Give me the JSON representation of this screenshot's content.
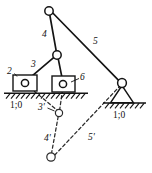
{
  "figure": {
    "type": "kinematic-linkage-diagram",
    "background_color": "#ffffff",
    "line_color": "#141414",
    "dashed_color": "#2a2a2a"
  },
  "labels": {
    "link_2": "2",
    "link_3": "3",
    "link_4": "4",
    "link_5": "5",
    "link_6": "6",
    "link_3_prime": "3'",
    "link_4_prime": "4'",
    "link_5_prime": "5'",
    "ground_left": "1;0",
    "ground_right": "1;0"
  },
  "geometry": {
    "apex_joint": {
      "cx": 49,
      "cy": 11,
      "r": 4.2
    },
    "mid_joint": {
      "cx": 57,
      "cy": 55,
      "r": 4.2
    },
    "right_pivot": {
      "cx": 122,
      "cy": 83,
      "r": 4.4
    },
    "slider_left": {
      "x": 13,
      "y": 75,
      "w": 24,
      "h": 16,
      "pin_cx": 25,
      "pin_cy": 83,
      "pin_r": 3.6
    },
    "slider_right": {
      "x": 52,
      "y": 76,
      "w": 23,
      "h": 16,
      "pin_cx": 63,
      "pin_cy": 84,
      "pin_r": 3.6
    },
    "ground_left_line": {
      "x1": 4,
      "y1": 93,
      "x2": 88,
      "y2": 93
    },
    "ground_right_line": {
      "x1": 103,
      "y1": 103,
      "x2": 146,
      "y2": 103
    },
    "support_triangle": {
      "apex_x": 122,
      "apex_y": 85,
      "left_x": 110,
      "right_x": 134,
      "base_y": 103
    },
    "dashed_joint_mid": {
      "cx": 59,
      "cy": 113,
      "r": 3.6
    },
    "dashed_joint_low": {
      "cx": 51,
      "cy": 157,
      "r": 4.2
    }
  },
  "links": {
    "solid": [
      {
        "name": "link-4-apex-to-mid",
        "from": "apex_joint",
        "to": "mid_joint"
      },
      {
        "name": "link-5-apex-to-right-pivot",
        "from": "apex_joint",
        "to": "right_pivot"
      },
      {
        "name": "link-3-mid-to-left-slider",
        "from": "mid_joint",
        "to": "slider_left_pin"
      },
      {
        "name": "link-6-mid-to-right-slider",
        "from": "mid_joint",
        "to": "slider_right_pin"
      }
    ],
    "dashed": [
      {
        "name": "link-3-prime",
        "from": "slider_left_pin",
        "to": "dashed_joint_mid"
      },
      {
        "name": "link-4-prime",
        "from": "dashed_joint_mid",
        "to": "dashed_joint_low"
      },
      {
        "name": "link-6-prime-vertical",
        "from": "slider_right_pin",
        "to": "dashed_joint_mid"
      },
      {
        "name": "link-5-prime",
        "from": "dashed_joint_low",
        "to": "right_pivot"
      }
    ]
  },
  "label_positions": {
    "link_2": {
      "x": 9,
      "y": 74
    },
    "link_3": {
      "x": 33,
      "y": 66
    },
    "link_4": {
      "x": 44,
      "y": 36
    },
    "link_5": {
      "x": 94,
      "y": 43
    },
    "link_6": {
      "x": 81,
      "y": 80
    },
    "link_3_prime": {
      "x": 40,
      "y": 110
    },
    "link_4_prime": {
      "x": 46,
      "y": 140
    },
    "link_5_prime": {
      "x": 90,
      "y": 140
    },
    "ground_left": {
      "x": 12,
      "y": 107
    },
    "ground_right": {
      "x": 115,
      "y": 117
    }
  }
}
